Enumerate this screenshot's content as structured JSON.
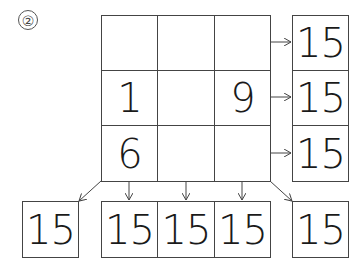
{
  "problem_label": "②",
  "grid": {
    "rows": [
      [
        "",
        "",
        ""
      ],
      [
        "1",
        "",
        "9"
      ],
      [
        "6",
        "",
        ""
      ]
    ]
  },
  "row_sums": [
    "15",
    "15",
    "15"
  ],
  "diagonal_sums": {
    "anti_diagonal": "15",
    "main_diagonal": "15"
  },
  "column_sums": [
    "15",
    "15",
    "15"
  ],
  "colors": {
    "line": "#444444",
    "text": "#1a1a1a",
    "background": "#ffffff"
  }
}
